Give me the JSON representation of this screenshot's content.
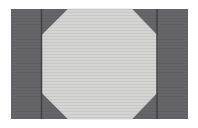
{
  "figure": {
    "canvas": {
      "width": 198,
      "height": 128,
      "background_color": "#ffffff"
    },
    "plate": {
      "label": "dark-rectangular-plate",
      "x": 11,
      "y": 9,
      "width": 177,
      "height": 110,
      "fill_color": "#66666a"
    },
    "octagon": {
      "label": "light-octagon",
      "fill_color": "#d4d4d2",
      "stroke_color": "#c8c8c6",
      "points": [
        [
          68,
          9
        ],
        [
          132,
          9
        ],
        [
          157,
          35
        ],
        [
          157,
          93
        ],
        [
          132,
          119
        ],
        [
          68,
          119
        ],
        [
          42,
          93
        ],
        [
          42,
          35
        ]
      ]
    },
    "divider_left": {
      "label": "left-vertical-divider",
      "x": 41.5,
      "y_top": 9,
      "y_bottom": 119,
      "stroke_color": "#3f3f42",
      "stroke_width": 1.4
    },
    "divider_right": {
      "label": "right-vertical-divider",
      "x": 157,
      "y_top": 9,
      "y_bottom": 119,
      "stroke_color": "#3f3f42",
      "stroke_width": 1.4
    },
    "scanline_texture": {
      "label": "horizontal-scanline-texture",
      "color": "#000000",
      "opacity": 0.055,
      "spacing": 3,
      "thickness": 1
    },
    "corner_wedges": [
      {
        "label": "wedge-top-left",
        "points": [
          [
            42,
            9
          ],
          [
            68,
            9
          ],
          [
            42,
            35
          ]
        ]
      },
      {
        "label": "wedge-top-right",
        "points": [
          [
            132,
            9
          ],
          [
            157,
            9
          ],
          [
            157,
            35
          ]
        ]
      },
      {
        "label": "wedge-bottom-left",
        "points": [
          [
            42,
            93
          ],
          [
            68,
            119
          ],
          [
            42,
            119
          ]
        ]
      },
      {
        "label": "wedge-bottom-right",
        "points": [
          [
            157,
            93
          ],
          [
            157,
            119
          ],
          [
            132,
            119
          ]
        ]
      }
    ]
  }
}
